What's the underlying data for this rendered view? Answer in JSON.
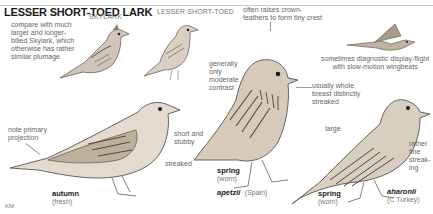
{
  "title": "LESSER SHORT-TOED LARK",
  "captions": {
    "skylark": "SKYLARK",
    "lesser_short_toed": "LESSER SHORT-TOED"
  },
  "notes": {
    "compare": "compare with much\nlarger and longer-\nbilled Skylark, which\notherwise has rather\nsimilar plumage",
    "crest": "often raises crown-\nfeathers to form tiny crest",
    "flight": "sometimes diagnostic display-flight\nwith slow-motion wingbeats",
    "contrast": "generally\nonly\nmoderate\ncontrast",
    "breast": "usually whole\nbreast distinctly\nstreaked",
    "primary": "note primary\nprojection",
    "bill": "short and\nstubby",
    "streaked": "streaked",
    "large": "large",
    "fine": "rather\nfine\nstreak-\ning"
  },
  "figures": {
    "autumn": {
      "season": "autumn",
      "state": "(fresh)"
    },
    "spring_apetzii": {
      "season": "spring",
      "state": "(worn)",
      "subspecies": "apetzii",
      "region": "(Spain)"
    },
    "spring_aharonii": {
      "season": "spring",
      "state": "(worn)",
      "subspecies": "aharonii",
      "region": "(C Turkey)"
    }
  },
  "signature": "KM"
}
